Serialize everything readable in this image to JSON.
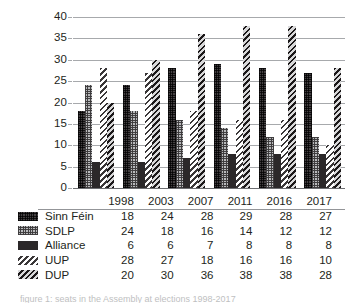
{
  "chart_data": {
    "type": "bar",
    "title": "",
    "xlabel": "",
    "ylabel": "",
    "ylim": [
      0,
      40
    ],
    "ytick_step": 5,
    "yticks": [
      0,
      5,
      10,
      15,
      20,
      25,
      30,
      35,
      40
    ],
    "grid": true,
    "legend_position": "table-below",
    "categories": [
      "1998",
      "2003",
      "2007",
      "2011",
      "2016",
      "2017"
    ],
    "series": [
      {
        "name": "Sinn Féin",
        "values": [
          18,
          24,
          28,
          29,
          28,
          27
        ],
        "pattern": "dark-checker",
        "color": "#454143"
      },
      {
        "name": "SDLP",
        "values": [
          24,
          18,
          16,
          14,
          12,
          12
        ],
        "pattern": "light-grid",
        "color": "#b9babc"
      },
      {
        "name": "Alliance",
        "values": [
          6,
          6,
          7,
          8,
          8,
          8
        ],
        "pattern": "solid-dark",
        "color": "#2b2829"
      },
      {
        "name": "UUP",
        "values": [
          28,
          27,
          18,
          16,
          16,
          10
        ],
        "pattern": "light-diagonal-hatch",
        "color": "#ffffff"
      },
      {
        "name": "DUP",
        "values": [
          20,
          30,
          36,
          38,
          38,
          28
        ],
        "pattern": "dark-diagonal-hatch",
        "color": "#4a4648"
      }
    ]
  },
  "table": {
    "corner_label": "",
    "year_headers": [
      "1998",
      "2003",
      "2007",
      "2011",
      "2016",
      "2017"
    ],
    "rows": [
      {
        "label": "Sinn Féin",
        "values": [
          "18",
          "24",
          "28",
          "29",
          "28",
          "27"
        ]
      },
      {
        "label": "SDLP",
        "values": [
          "24",
          "18",
          "16",
          "14",
          "12",
          "12"
        ]
      },
      {
        "label": "Alliance",
        "values": [
          "6",
          "6",
          "7",
          "8",
          "8",
          "8"
        ]
      },
      {
        "label": "UUP",
        "values": [
          "28",
          "27",
          "18",
          "16",
          "16",
          "10"
        ]
      },
      {
        "label": "DUP",
        "values": [
          "20",
          "30",
          "36",
          "38",
          "38",
          "28"
        ]
      }
    ]
  },
  "caption": "figure 1: seats in the Assembly at elections 1998-2017"
}
